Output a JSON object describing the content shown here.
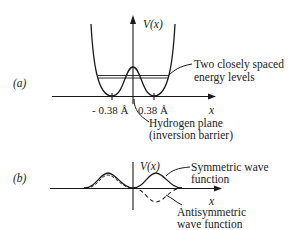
{
  "panel_a": {
    "label": "(a)",
    "y_axis_label": "V(x)",
    "x_axis_label": "x",
    "tick_left": "- 0.38 Å",
    "tick_right": "0.38 Å",
    "annotation_levels": [
      "Two closely spaced",
      "energy levels"
    ],
    "annotation_plane": [
      "Hydrogen plane",
      "(inversion barrier)"
    ]
  },
  "panel_b": {
    "label": "(b)",
    "y_axis_label": "V(x)",
    "x_axis_label": "x",
    "annotation_symmetric": [
      "Symmetric wave",
      "function"
    ],
    "annotation_antisymmetric": [
      "Antisymmetric",
      "wave function"
    ]
  }
}
